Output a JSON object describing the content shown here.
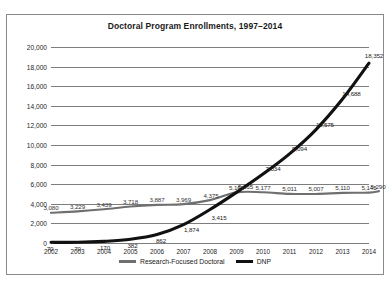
{
  "chart_data": {
    "type": "line",
    "title": "Doctoral Program Enrollments, 1997–2014",
    "xlabel": "",
    "ylabel": "",
    "grid": "horizontal",
    "legend_position": "bottom",
    "ylim": [
      0,
      20000
    ],
    "yticks": [
      "0",
      "2,000",
      "4,000",
      "6,000",
      "8,000",
      "10,000",
      "12,000",
      "14,000",
      "16,000",
      "18,000",
      "20,000"
    ],
    "ytick_values": [
      0,
      2000,
      4000,
      6000,
      8000,
      10000,
      12000,
      14000,
      16000,
      18000,
      20000
    ],
    "categories": [
      "2002",
      "2003",
      "2004",
      "2005",
      "2006",
      "2007",
      "2008",
      "2009",
      "2010",
      "2011",
      "2012",
      "2013",
      "2014"
    ],
    "series": [
      {
        "name": "Research-Focused Doctoral",
        "color": "#6f6f6f",
        "values": [
          3080,
          3229,
          3439,
          3718,
          3887,
          3969,
          4375,
          5165,
          5177,
          5011,
          5007,
          5110,
          5145
        ],
        "labels": [
          "3,080",
          "3,229",
          "3,439",
          "3,718",
          "3,887",
          "3,969",
          "4,375",
          "5,165",
          "5,177",
          "5,011",
          "5,007",
          "5,110",
          "5,145"
        ],
        "end_label": "5,290",
        "end_value": 5290
      },
      {
        "name": "DNP",
        "color": "#111111",
        "values": [
          70,
          70,
          170,
          382,
          862,
          1874,
          3415,
          5165,
          7034,
          9094,
          11575,
          14688,
          18352
        ],
        "labels": [
          "70",
          "70",
          "170",
          "382",
          "862",
          "1,874",
          "3,415",
          "5,165",
          "7,034",
          "9,094",
          "11,575",
          "14,688",
          "18,352"
        ]
      }
    ]
  },
  "legend": {
    "entries": [
      {
        "label": "Research-Focused Doctoral",
        "marker": "gray-line-swatch"
      },
      {
        "label": "DNP",
        "marker": "black-line-swatch"
      }
    ]
  }
}
